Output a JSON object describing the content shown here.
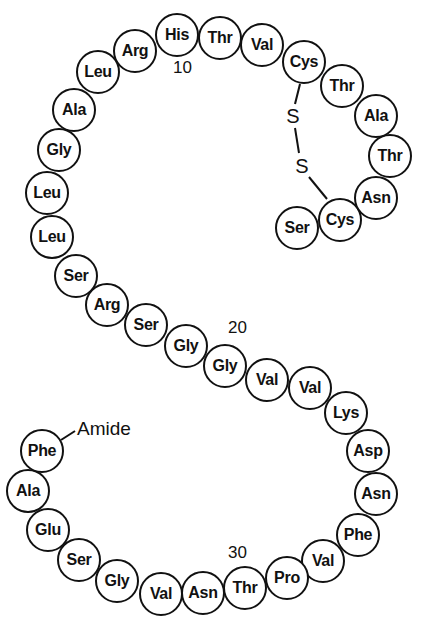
{
  "diagram": {
    "type": "peptide-sequence-schematic",
    "colors": {
      "stroke": "#111111",
      "background": "#ffffff"
    },
    "residues": [
      {
        "index": 1,
        "name": "Ser",
        "x": 297,
        "y": 228
      },
      {
        "index": 2,
        "name": "Cys",
        "x": 340,
        "y": 220
      },
      {
        "index": 3,
        "name": "Asn",
        "x": 376,
        "y": 198
      },
      {
        "index": 4,
        "name": "Thr",
        "x": 390,
        "y": 156
      },
      {
        "index": 5,
        "name": "Ala",
        "x": 376,
        "y": 116
      },
      {
        "index": 6,
        "name": "Thr",
        "x": 342,
        "y": 86
      },
      {
        "index": 7,
        "name": "Cys",
        "x": 304,
        "y": 62
      },
      {
        "index": 8,
        "name": "Val",
        "x": 262,
        "y": 45
      },
      {
        "index": 9,
        "name": "Thr",
        "x": 220,
        "y": 38
      },
      {
        "index": 10,
        "name": "His",
        "x": 177,
        "y": 35
      },
      {
        "index": 11,
        "name": "Arg",
        "x": 135,
        "y": 51
      },
      {
        "index": 12,
        "name": "Leu",
        "x": 98,
        "y": 72
      },
      {
        "index": 13,
        "name": "Ala",
        "x": 74,
        "y": 110
      },
      {
        "index": 14,
        "name": "Gly",
        "x": 59,
        "y": 150
      },
      {
        "index": 15,
        "name": "Leu",
        "x": 47,
        "y": 193
      },
      {
        "index": 16,
        "name": "Leu",
        "x": 52,
        "y": 237
      },
      {
        "index": 17,
        "name": "Ser",
        "x": 76,
        "y": 276
      },
      {
        "index": 18,
        "name": "Arg",
        "x": 107,
        "y": 305
      },
      {
        "index": 19,
        "name": "Ser",
        "x": 146,
        "y": 325
      },
      {
        "index": 20,
        "name": "Gly",
        "x": 186,
        "y": 346
      },
      {
        "index": 21,
        "name": "Gly",
        "x": 225,
        "y": 366
      },
      {
        "index": 22,
        "name": "Val",
        "x": 267,
        "y": 380
      },
      {
        "index": 23,
        "name": "Val",
        "x": 310,
        "y": 388
      },
      {
        "index": 24,
        "name": "Lys",
        "x": 346,
        "y": 413
      },
      {
        "index": 25,
        "name": "Asp",
        "x": 368,
        "y": 451
      },
      {
        "index": 26,
        "name": "Asn",
        "x": 376,
        "y": 494
      },
      {
        "index": 27,
        "name": "Phe",
        "x": 358,
        "y": 535
      },
      {
        "index": 28,
        "name": "Val",
        "x": 323,
        "y": 561
      },
      {
        "index": 29,
        "name": "Pro",
        "x": 287,
        "y": 578
      },
      {
        "index": 30,
        "name": "Thr",
        "x": 245,
        "y": 588
      },
      {
        "index": 31,
        "name": "Asn",
        "x": 203,
        "y": 593
      },
      {
        "index": 32,
        "name": "Val",
        "x": 161,
        "y": 594
      },
      {
        "index": 33,
        "name": "Gly",
        "x": 117,
        "y": 581
      },
      {
        "index": 34,
        "name": "Ser",
        "x": 79,
        "y": 560
      },
      {
        "index": 35,
        "name": "Glu",
        "x": 48,
        "y": 530
      },
      {
        "index": 36,
        "name": "Ala",
        "x": 28,
        "y": 491
      },
      {
        "index": 37,
        "name": "Phe",
        "x": 42,
        "y": 451
      }
    ],
    "number_labels": [
      {
        "text": "10",
        "x": 173,
        "y": 58
      },
      {
        "text": "20",
        "x": 228,
        "y": 318
      },
      {
        "text": "30",
        "x": 228,
        "y": 543
      }
    ],
    "terminal_label": {
      "text": "Amide",
      "x": 77,
      "y": 418
    },
    "disulfide": {
      "atoms": [
        {
          "text": "S",
          "x": 293,
          "y": 116
        },
        {
          "text": "S",
          "x": 302,
          "y": 166
        }
      ],
      "bonds": [
        {
          "x1": 300,
          "y1": 84,
          "x2": 295,
          "y2": 104
        },
        {
          "x1": 295,
          "y1": 128,
          "x2": 299,
          "y2": 153
        },
        {
          "x1": 309,
          "y1": 177,
          "x2": 327,
          "y2": 199
        }
      ]
    },
    "amide_bond": {
      "x1": 61,
      "y1": 440,
      "x2": 75,
      "y2": 431
    }
  }
}
